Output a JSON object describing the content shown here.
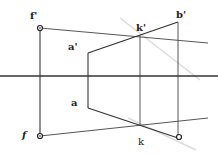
{
  "diagram": {
    "type": "perspective-projection-construction",
    "labels": {
      "f_prime": "f'",
      "f": "f",
      "a_prime": "a'",
      "a": "a",
      "k_prime": "k'",
      "k": "k",
      "b_prime": "b'"
    },
    "colors": {
      "line": "#333333",
      "faint_line": "#d0d0d0",
      "background": "#ffffff"
    }
  }
}
